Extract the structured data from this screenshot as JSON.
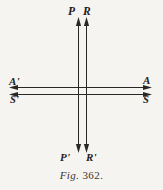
{
  "figure": {
    "caption_prefix": "Fig.",
    "caption_number": "362.",
    "background_color": "#f5f4f1",
    "ink_color": "#2a2724",
    "labels": {
      "top_left_ray": "P",
      "top_right_ray": "R",
      "left_upper_ray": "A'",
      "left_lower_ray": "S'",
      "right_upper_ray": "A",
      "right_lower_ray": "S",
      "bottom_left_ray": "P'",
      "bottom_right_ray": "R'"
    },
    "geometry": {
      "vertical_line_x": [
        78,
        86
      ],
      "horizontal_line_y": [
        87,
        94
      ],
      "vertical_top_y": 18,
      "vertical_bottom_y": 150,
      "horizontal_left_x": 11,
      "horizontal_right_x": 150,
      "arrow_directions": {
        "vertical_up": "up",
        "vertical_down": "down",
        "horizontal_left": "left",
        "horizontal_right": "right"
      },
      "arrow_count": {
        "top": 2,
        "bottom": 2,
        "left": 2,
        "right": 2
      }
    }
  }
}
